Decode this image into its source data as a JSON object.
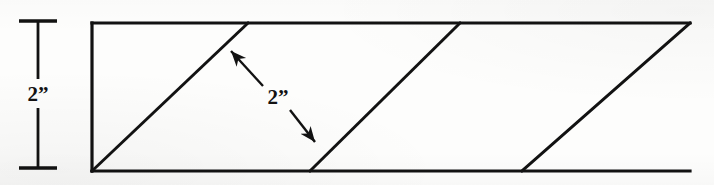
{
  "figure": {
    "background_color": "#fdfdfc",
    "ink_color": "#121212"
  },
  "labels": {
    "height_dimension": "2”",
    "slant_dimension": "2”"
  },
  "height_dimension": {
    "name": "vertical height dimension",
    "value": "2”",
    "x": 38,
    "y_top": 21,
    "y_bottom": 168,
    "cap_half_width": 19,
    "label_x": 38,
    "label_y": 99
  },
  "slant_dimension": {
    "name": "slant width double arrow",
    "value": "2”",
    "from_x": 228,
    "from_y": 48,
    "to_x": 318,
    "to_y": 145,
    "label_x": 278,
    "label_y": 103
  },
  "strip": {
    "name": "parallelogram strip outline",
    "top_y": 23,
    "bottom_y": 171,
    "left_x": 92,
    "right_x": 690
  },
  "diagonals": [
    {
      "name": "diagonal-1",
      "x_bottom": 92,
      "y_bottom": 171,
      "x_top": 248,
      "y_top": 23
    },
    {
      "name": "diagonal-2",
      "x_bottom": 310,
      "y_bottom": 171,
      "x_top": 460,
      "y_top": 23
    },
    {
      "name": "diagonal-3",
      "x_bottom": 522,
      "y_bottom": 171,
      "x_top": 690,
      "y_top": 23
    }
  ],
  "stroke": {
    "outline_width": 3.2,
    "diagonal_width": 3.0,
    "dimension_width": 2.8,
    "leader_width": 2.4
  }
}
